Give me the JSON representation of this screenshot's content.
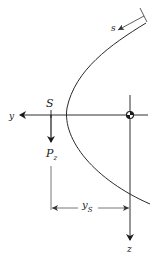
{
  "diagram": {
    "labels": {
      "s_coord": "s",
      "y_axis": "y",
      "z_axis": "z",
      "shear_center": "S",
      "load": "P",
      "load_sub": "z",
      "offset": "y",
      "offset_sub": "S"
    },
    "colors": {
      "ink": "#1a1a1a",
      "dimension": "#444444",
      "background": "#ffffff"
    }
  }
}
